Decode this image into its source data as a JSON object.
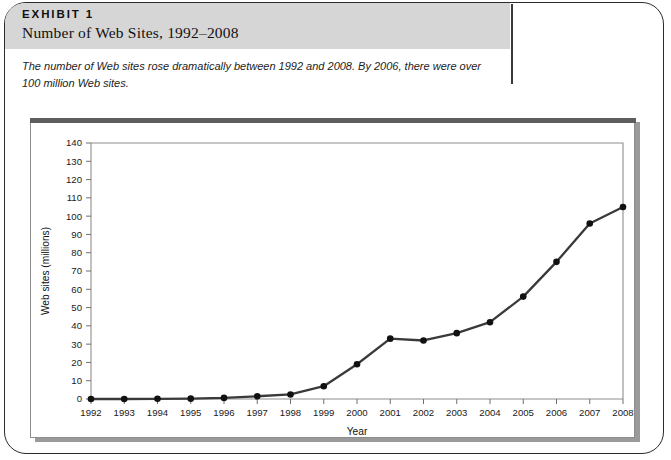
{
  "exhibit": {
    "label": "EXHIBIT 1",
    "title": "Number of Web Sites, 1992–2008",
    "caption": "The number of Web sites rose dramatically between 1992 and 2008. By 2006, there were over 100 million Web sites."
  },
  "colors": {
    "header_band": "#d6d6d6",
    "frame_border": "#2b2b2b",
    "series_line": "#3a3a3a",
    "marker": "#111111",
    "axis": "#8e8e8e",
    "chart_topbar": "#5d5d5d"
  },
  "chart_data": {
    "type": "line",
    "title": "",
    "xlabel": "Year",
    "ylabel": "Web sites (millions)",
    "categories": [
      "1992",
      "1993",
      "1994",
      "1995",
      "1996",
      "1997",
      "1998",
      "1999",
      "2000",
      "2001",
      "2002",
      "2003",
      "2004",
      "2005",
      "2006",
      "2007",
      "2008"
    ],
    "x": [
      1992,
      1993,
      1994,
      1995,
      1996,
      1997,
      1998,
      1999,
      2000,
      2001,
      2002,
      2003,
      2004,
      2005,
      2006,
      2007,
      2008
    ],
    "values": [
      0,
      0,
      0.1,
      0.2,
      0.6,
      1.5,
      2.5,
      7,
      19,
      33,
      32,
      36,
      42,
      56,
      75,
      96,
      105
    ],
    "ylim": [
      0,
      140
    ],
    "ytick_step": 10,
    "yticks": [
      0,
      10,
      20,
      30,
      40,
      50,
      60,
      70,
      80,
      90,
      100,
      110,
      120,
      130,
      140
    ],
    "grid": false,
    "legend": false,
    "marker": "circle",
    "series": [
      {
        "name": "Web sites (millions)",
        "values": [
          0,
          0,
          0.1,
          0.2,
          0.6,
          1.5,
          2.5,
          7,
          19,
          33,
          32,
          36,
          42,
          56,
          75,
          96,
          105
        ]
      }
    ]
  }
}
